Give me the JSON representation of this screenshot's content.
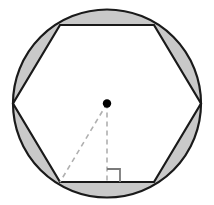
{
  "figure": {
    "width": 214,
    "height": 205,
    "background_color": "#ffffff"
  },
  "colors": {
    "stroke": "#1a1a1a",
    "segment_fill": "#c9c9c9",
    "polygon_fill": "#ffffff",
    "dashed_line": "#b0b0b0",
    "center_dot": "#000000",
    "right_angle_marker": "#7a7a7a"
  },
  "circle": {
    "label": "circumscribed-circle",
    "center_x": 107,
    "center_y": 103.5,
    "radius": 94,
    "stroke_width": 2.2,
    "fill": "none"
  },
  "hexagon": {
    "label": "inscribed-regular-hexagon",
    "sides": 6,
    "orientation": "flat-top",
    "stroke_width": 2.2,
    "vertices": [
      {
        "name": "top-left",
        "x": 60,
        "y": 25
      },
      {
        "name": "top-right",
        "x": 154,
        "y": 25
      },
      {
        "name": "right",
        "x": 201,
        "y": 103.5
      },
      {
        "name": "bottom-right",
        "x": 154,
        "y": 182
      },
      {
        "name": "bottom-left",
        "x": 60,
        "y": 182
      },
      {
        "name": "left",
        "x": 13,
        "y": 103.5
      }
    ]
  },
  "segments": {
    "label": "shaded-circular-segments",
    "count": 6,
    "fill": "#c9c9c9",
    "description": "Six shaded regions between each hexagon side and the circle arc"
  },
  "center_point": {
    "label": "center",
    "x": 107,
    "y": 103.5,
    "radius": 4.2
  },
  "radius_line": {
    "label": "radius-to-vertex",
    "x1": 107,
    "y1": 103.5,
    "x2": 60,
    "y2": 182,
    "style": "dashed"
  },
  "apothem_line": {
    "label": "apothem-perpendicular",
    "x1": 107,
    "y1": 103.5,
    "x2": 107,
    "y2": 182,
    "style": "dashed"
  },
  "right_angle": {
    "label": "right-angle-marker",
    "x": 107,
    "y": 182,
    "size": 13,
    "direction": "right-of-apothem"
  }
}
